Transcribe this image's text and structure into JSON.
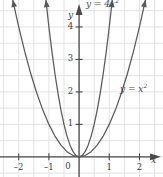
{
  "figure": {
    "name": "parabola-comparison-graph",
    "width": 163,
    "height": 177,
    "background": "#ffffff"
  },
  "colors": {
    "curve": "#5a5a5a",
    "axis": "#4a4a4a",
    "grid": "#e2e2e6",
    "text": "#3a3a3a",
    "label": "#4a4a4a"
  },
  "axes": {
    "x_name": "x",
    "y_name": "y",
    "x_ticks": [
      {
        "value": -2,
        "label": "–2"
      },
      {
        "value": -1,
        "label": "–1"
      },
      {
        "value": 1,
        "label": "1"
      },
      {
        "value": 2,
        "label": "2"
      }
    ],
    "y_ticks": [
      {
        "value": 1,
        "label": "1"
      },
      {
        "value": 2,
        "label": "2"
      },
      {
        "value": 3,
        "label": "3"
      },
      {
        "value": 4,
        "label": "4"
      }
    ],
    "origin_label": "0"
  },
  "chart_data": {
    "type": "line",
    "title": "",
    "xlabel": "x",
    "ylabel": "y",
    "xlim": [
      -2.62,
      2.78
    ],
    "ylim": [
      -0.62,
      4.83
    ],
    "grid": true,
    "grid_step": 0.5,
    "legend": "inline-curve-labels",
    "series": [
      {
        "name": "y = 4x²",
        "label": "y = 4x",
        "exponent": "2",
        "equation": "y = 4x^2",
        "coefficient": 4,
        "color": "#5a5a5a",
        "arrows": "both-ends",
        "x": [
          -1.1,
          -1.0,
          -0.9,
          -0.8,
          -0.7,
          -0.6,
          -0.5,
          -0.4,
          -0.3,
          -0.2,
          -0.1,
          0,
          0.1,
          0.2,
          0.3,
          0.4,
          0.5,
          0.6,
          0.7,
          0.8,
          0.9,
          1.0,
          1.1
        ],
        "y": [
          4.84,
          4.0,
          3.24,
          2.56,
          1.96,
          1.44,
          1.0,
          0.64,
          0.36,
          0.16,
          0.04,
          0,
          0.04,
          0.16,
          0.36,
          0.64,
          1.0,
          1.44,
          1.96,
          2.56,
          3.24,
          4.0,
          4.84
        ]
      },
      {
        "name": "y = x²",
        "label": "y = x",
        "exponent": "2",
        "equation": "y = x^2",
        "coefficient": 1,
        "color": "#5a5a5a",
        "arrows": "both-ends",
        "x": [
          -2.2,
          -2.0,
          -1.8,
          -1.6,
          -1.4,
          -1.2,
          -1.0,
          -0.8,
          -0.6,
          -0.4,
          -0.2,
          0,
          0.2,
          0.4,
          0.6,
          0.8,
          1.0,
          1.2,
          1.4,
          1.6,
          1.8,
          2.0,
          2.2
        ],
        "y": [
          4.84,
          4.0,
          3.24,
          2.56,
          1.96,
          1.44,
          1.0,
          0.64,
          0.36,
          0.16,
          0.04,
          0,
          0.04,
          0.16,
          0.36,
          0.64,
          1.0,
          1.44,
          1.96,
          2.56,
          3.24,
          4.0,
          4.84
        ]
      }
    ]
  }
}
